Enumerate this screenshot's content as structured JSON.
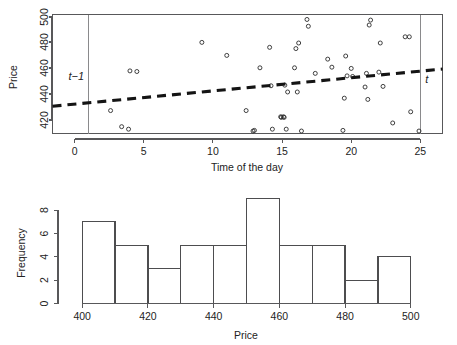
{
  "figure": {
    "background": "#ffffff",
    "ink_color": "#2b2b2b"
  },
  "chart_data": [
    {
      "id": "scatter-price-vs-time",
      "type": "scatter",
      "title": "",
      "xlabel": "Time of the day",
      "ylabel": "Price",
      "xlim": [
        -1.6,
        26.6
      ],
      "ylim": [
        406,
        502
      ],
      "xticks": [
        0,
        5,
        10,
        15,
        20,
        25
      ],
      "xticklabels": [
        "0",
        "5",
        "10",
        "15",
        "20",
        "25"
      ],
      "yticks": [
        420,
        440,
        460,
        480,
        500
      ],
      "yticklabels": [
        "420",
        "440",
        "460",
        "480",
        "500"
      ],
      "grid": false,
      "legend": null,
      "points": [
        [
          2.6,
          424.5
        ],
        [
          3.4,
          411.5
        ],
        [
          3.9,
          409.5
        ],
        [
          4.0,
          456.5
        ],
        [
          4.5,
          456.0
        ],
        [
          9.2,
          479.5
        ],
        [
          11.0,
          469.0
        ],
        [
          12.4,
          424.5
        ],
        [
          13.0,
          408.5
        ],
        [
          13.4,
          459.0
        ],
        [
          14.1,
          475.5
        ],
        [
          14.2,
          444.5
        ],
        [
          14.3,
          409.5
        ],
        [
          14.9,
          419.5
        ],
        [
          15.1,
          419.5
        ],
        [
          15.2,
          445.0
        ],
        [
          15.3,
          409.5
        ],
        [
          15.4,
          439.5
        ],
        [
          15.9,
          459.0
        ],
        [
          16.0,
          474.5
        ],
        [
          16.1,
          439.5
        ],
        [
          16.2,
          479.0
        ],
        [
          16.4,
          408.0
        ],
        [
          16.8,
          498.0
        ],
        [
          16.9,
          492.5
        ],
        [
          17.4,
          454.5
        ],
        [
          18.3,
          466.0
        ],
        [
          18.6,
          459.5
        ],
        [
          19.4,
          408.5
        ],
        [
          19.5,
          434.5
        ],
        [
          19.6,
          468.5
        ],
        [
          19.7,
          452.5
        ],
        [
          20.0,
          458.5
        ],
        [
          21.0,
          443.5
        ],
        [
          21.1,
          454.5
        ],
        [
          21.2,
          433.5
        ],
        [
          21.3,
          493.5
        ],
        [
          21.4,
          497.5
        ],
        [
          22.0,
          455.5
        ],
        [
          22.1,
          479.0
        ],
        [
          22.3,
          444.0
        ],
        [
          23.0,
          414.5
        ],
        [
          23.9,
          484.0
        ],
        [
          24.2,
          484.0
        ],
        [
          24.3,
          423.5
        ],
        [
          24.9,
          408.0
        ],
        [
          12.9,
          408.0
        ],
        [
          15.15,
          419.0
        ],
        [
          14.95,
          419.0
        ],
        [
          20.1,
          452.0
        ]
      ],
      "trendline": {
        "label": "fitted trend",
        "style": "dashed",
        "x": [
          -1.6,
          26.6
        ],
        "y": [
          428.0,
          458.0
        ]
      },
      "vlines": [
        {
          "x": 1.0,
          "label": "t−1",
          "label_side": "left"
        },
        {
          "x": 25.0,
          "label": "t",
          "label_side": "right"
        }
      ]
    },
    {
      "id": "histogram-price",
      "type": "bar",
      "title": "",
      "xlabel": "Price",
      "ylabel": "Frequency",
      "xlim": [
        394,
        506
      ],
      "ylim": [
        0,
        9
      ],
      "xticks": [
        400,
        420,
        440,
        460,
        480,
        500
      ],
      "xticklabels": [
        "400",
        "420",
        "440",
        "460",
        "480",
        "500"
      ],
      "yticks": [
        0,
        2,
        4,
        6,
        8
      ],
      "yticklabels": [
        "0",
        "2",
        "4",
        "6",
        "8"
      ],
      "grid": false,
      "legend": null,
      "bin_edges": [
        400,
        410,
        420,
        430,
        440,
        450,
        460,
        470,
        480,
        490,
        500
      ],
      "categories": [
        "400-410",
        "410-420",
        "420-430",
        "430-440",
        "440-450",
        "450-460",
        "460-470",
        "470-480",
        "480-490",
        "490-500"
      ],
      "values": [
        7,
        5,
        3,
        5,
        5,
        9,
        5,
        5,
        2,
        4
      ]
    }
  ]
}
